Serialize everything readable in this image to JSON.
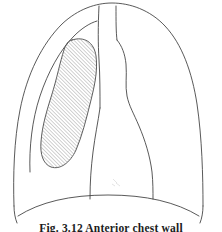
{
  "figure": {
    "caption": "Fig. 3.12  Anterior chest wall",
    "background_color": "#ffffff",
    "line_color": "#3b3b3b",
    "hatch_color": "#9a9a9a",
    "caption_color": "#1c1c1c"
  },
  "structures": {
    "chest_wall": {
      "label": "chest-wall-outline",
      "description": "Outer thoracic cage contour, domed apex"
    },
    "inner_lung_border_left": {
      "label": "left-lung-inner-border",
      "description": "Inner pleural line on the left hemithorax"
    },
    "trachea": {
      "label": "trachea",
      "description": "Two vertical parallel lines at upper midline"
    },
    "mediastinum": {
      "label": "mediastinal-silhouette",
      "description": "Central cardiac and mediastinal outline widening inferiorly"
    },
    "mass": {
      "label": "hatched-lung-mass",
      "description": "Elongated bean-shaped hatched opacity in the left lung field",
      "fill": "diagonal-hatching",
      "hatch_angle_degrees": 45,
      "hatch_spacing_px": 2
    },
    "diaphragm": {
      "label": "diaphragm",
      "description": "Curved inferior border of the thorax"
    },
    "costophrenic_left": {
      "label": "left-costophrenic-angle"
    },
    "costophrenic_right": {
      "label": "right-costophrenic-angle"
    }
  }
}
